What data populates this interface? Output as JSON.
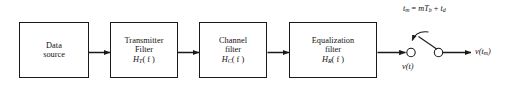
{
  "diagram": {
    "stroke_color": "#1a1a1a",
    "text_color": "#111111",
    "background_color": "#ffffff",
    "blocks": [
      {
        "id": "data-source",
        "line1": "Data",
        "line2": "source",
        "line3": ""
      },
      {
        "id": "transmitter-filter",
        "line1": "Transmitter",
        "line2": "Filter",
        "line3": "H",
        "sub": "T",
        "arg": "( f )"
      },
      {
        "id": "channel-filter",
        "line1": "Channel",
        "line2": "filter",
        "line3": "H",
        "sub": "C",
        "arg": "( f )"
      },
      {
        "id": "equalization-filter",
        "line1": "Equalization",
        "line2": "filter",
        "line3": "H",
        "sub": "R",
        "arg": "( f )"
      }
    ],
    "labels": {
      "timing_t": "t",
      "timing_t_sub": "m",
      "timing_eq": " = ",
      "timing_m": "m",
      "timing_T": "T",
      "timing_T_sub": "b",
      "timing_plus": " + ",
      "timing_td": "t",
      "timing_td_sub": "d",
      "signal_vt": "v(t)",
      "output_v": "v(t",
      "output_sub": "m",
      "output_close": ")"
    }
  }
}
